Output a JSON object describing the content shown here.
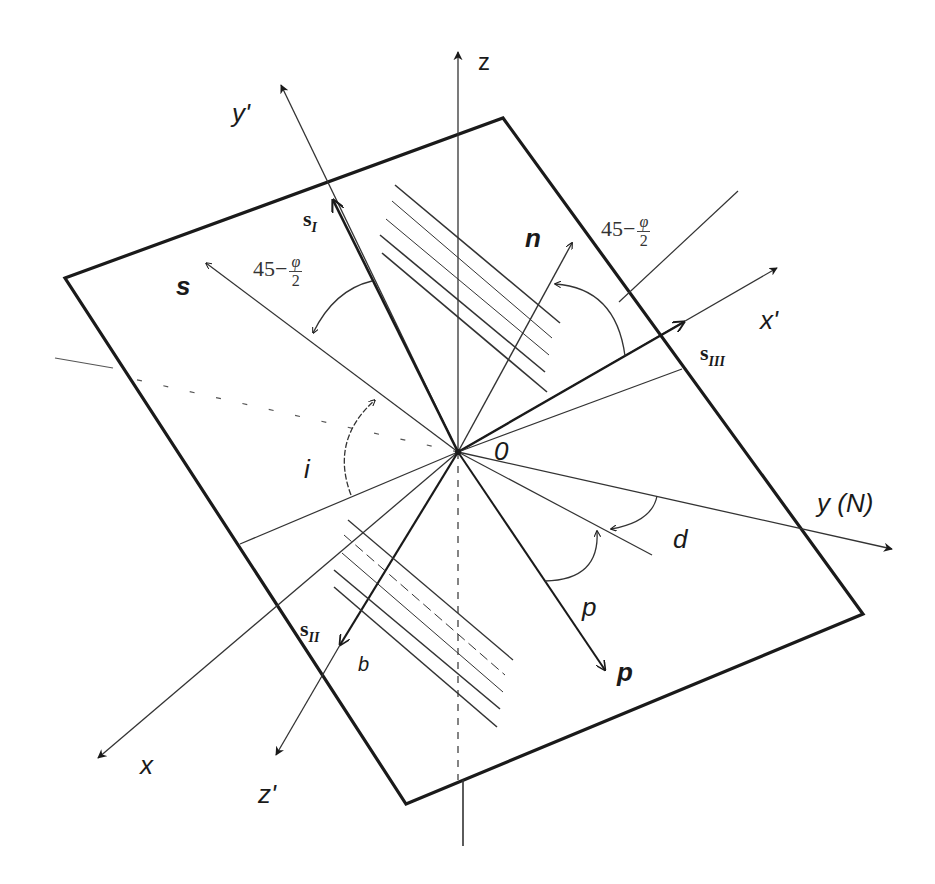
{
  "diagram": {
    "type": "3D geometric diagram of an inclined plane with coordinate axes and stress vectors",
    "labels": {
      "z": "z",
      "y_prime": "y'",
      "x_prime": "x'",
      "z_prime": "z'",
      "x": "x",
      "y_n": "y (N)",
      "origin": "0",
      "s": "s",
      "n": "n",
      "p": "p",
      "b": "b",
      "i": "i",
      "d": "d",
      "p_angle": "p",
      "s_I": {
        "base": "s",
        "sub": "I"
      },
      "s_II": {
        "base": "s",
        "sub": "II"
      },
      "s_III": {
        "base": "s",
        "sub": "III"
      },
      "angle_left": {
        "prefix": "45−",
        "num": "φ",
        "den": "2"
      },
      "angle_right": {
        "prefix": "45−",
        "num": "φ",
        "den": "2"
      }
    },
    "colors": {
      "line": "#1a1a1a",
      "thin_line": "#333333",
      "background": "#ffffff"
    },
    "plane_corners": [
      [
        65,
        278
      ],
      [
        503,
        118
      ],
      [
        863,
        614
      ],
      [
        406,
        804
      ]
    ],
    "origin_point": [
      458,
      452
    ]
  }
}
